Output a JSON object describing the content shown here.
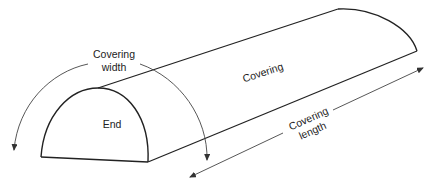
{
  "diagram": {
    "type": "half-cylinder covering schematic",
    "labels": {
      "covering_width_line1": "Covering",
      "covering_width_line2": "width",
      "covering": "Covering",
      "end": "End",
      "covering_length_line1": "Covering",
      "covering_length_line2": "length"
    },
    "colors": {
      "stroke": "#222222",
      "arrow": "#444444",
      "background": "#ffffff"
    }
  }
}
